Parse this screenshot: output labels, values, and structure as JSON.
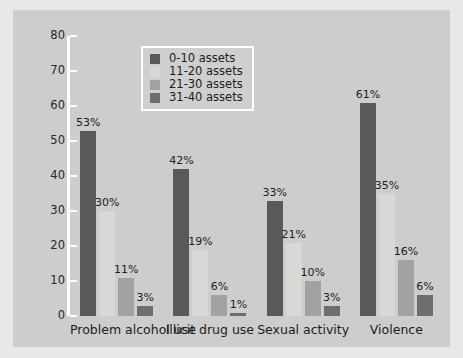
{
  "chart_data": {
    "type": "bar",
    "title": "",
    "subtitle": "",
    "xlabel": "",
    "ylabel": "",
    "categories": [
      "Problem alcohol use",
      "Illicit drug use",
      "Sexual activity",
      "Violence"
    ],
    "series": [
      {
        "name": "0-10 assets",
        "color": "#59595b",
        "values": [
          53,
          42,
          33,
          61
        ],
        "labels": [
          "53%",
          "42%",
          "33%",
          "61%"
        ]
      },
      {
        "name": "11-20 assets",
        "color": "#d8d8d6",
        "values": [
          30,
          19,
          21,
          35
        ],
        "labels": [
          "30%",
          "19%",
          "21%",
          "35%"
        ]
      },
      {
        "name": "21-30 assets",
        "color": "#a2a2a2",
        "values": [
          11,
          6,
          10,
          16
        ],
        "labels": [
          "11%",
          "6%",
          "10%",
          "16%"
        ]
      },
      {
        "name": "31-40 assets",
        "color": "#6e6e70",
        "values": [
          3,
          1,
          3,
          6
        ],
        "labels": [
          "3%",
          "1%",
          "3%",
          "6%"
        ]
      }
    ],
    "ylim": [
      0,
      80
    ],
    "yticks": [
      0,
      10,
      20,
      30,
      40,
      50,
      60,
      70,
      80
    ],
    "ytick_labels": [
      "0",
      "10",
      "20",
      "30",
      "40",
      "50",
      "60",
      "70",
      "80"
    ],
    "grid": false,
    "legend_position": "top-center",
    "value_suffix": "%",
    "background_color": "#cdcdcd",
    "axis_color": "#fdfdfd"
  },
  "legend": {
    "items": [
      {
        "label": "0-10 assets",
        "color": "#59595b"
      },
      {
        "label": "11-20 assets",
        "color": "#d8d8d6"
      },
      {
        "label": "21-30 assets",
        "color": "#a2a2a2"
      },
      {
        "label": "31-40 assets",
        "color": "#6e6e70"
      }
    ]
  }
}
